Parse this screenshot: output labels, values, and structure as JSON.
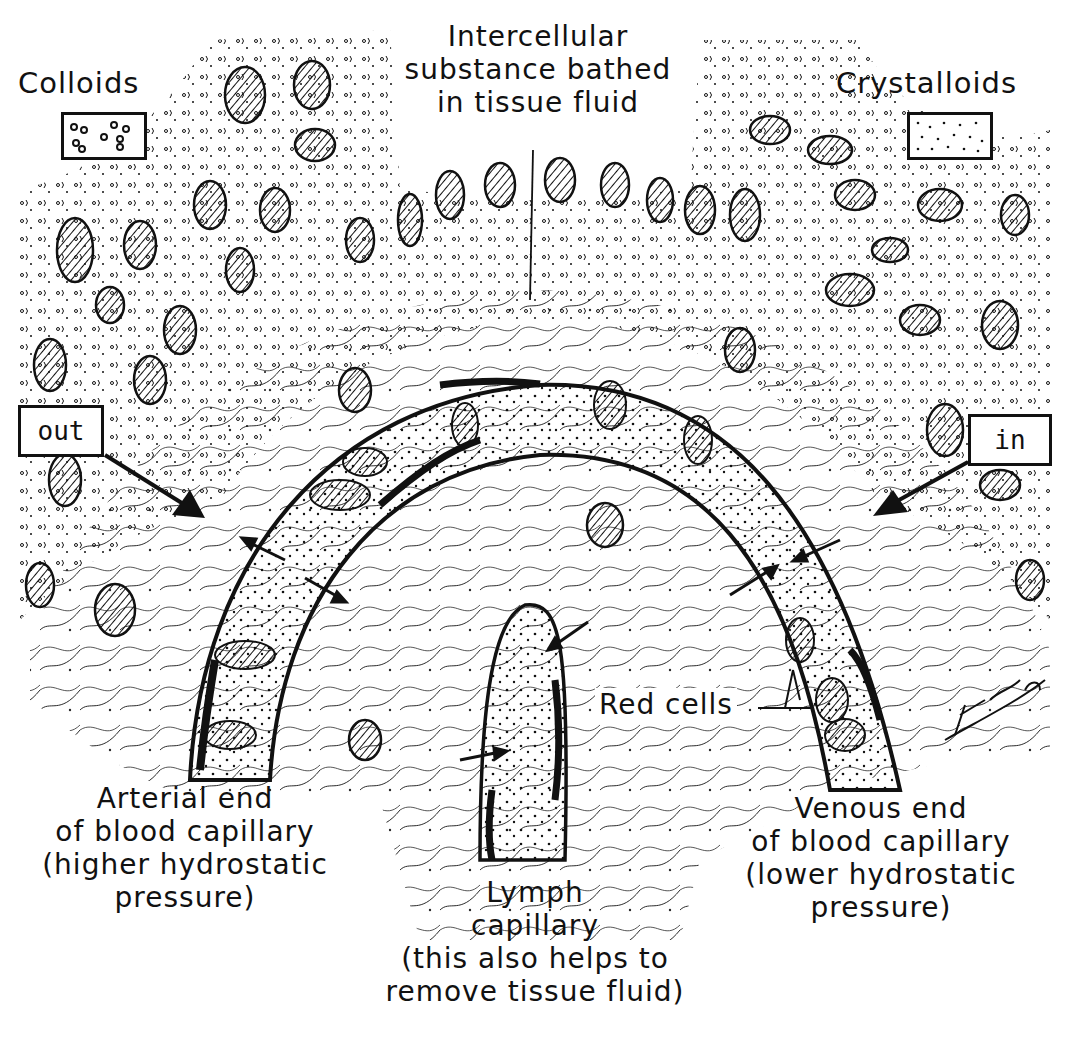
{
  "diagram": {
    "type": "anatomical illustration",
    "signature": "TQ Hubb",
    "colors": {
      "ink": "#111111",
      "background": "#ffffff"
    }
  },
  "legend": {
    "colloids": {
      "label": "Colloids",
      "symbol": "circles-in-box"
    },
    "crystalloids": {
      "label": "Crystalloids",
      "symbol": "dots-in-box"
    }
  },
  "labels": {
    "intercellular": [
      "Intercellular",
      "substance bathed",
      "in tissue fluid"
    ],
    "out": "out",
    "in": "in",
    "red_cells": "Red cells",
    "arterial": [
      "Arterial end",
      "of blood capillary",
      "(higher hydrostatic",
      "pressure)"
    ],
    "lymph": [
      "Lymph",
      "capillary",
      "(this also helps to",
      "remove tissue fluid)"
    ],
    "venous": [
      "Venous end",
      "of blood capillary",
      "(lower hydrostatic",
      "pressure)"
    ]
  }
}
